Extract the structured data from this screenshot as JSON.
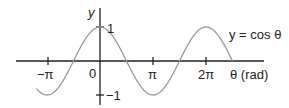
{
  "chart_data": {
    "type": "line",
    "title": "",
    "function": "cos",
    "series": [
      {
        "name": "y = cos θ",
        "x_start_rad": -3.77,
        "x_end_rad": 7.85,
        "color": "#9a9a9a"
      }
    ],
    "xlabel": "θ (rad)",
    "ylabel": "y",
    "x_ticks": [
      {
        "value": -3.14159,
        "label": "−π"
      },
      {
        "value": 0,
        "label": "0"
      },
      {
        "value": 3.14159,
        "label": "π"
      },
      {
        "value": 6.28319,
        "label": "2π"
      }
    ],
    "y_ticks": [
      {
        "value": 1,
        "label": "1"
      },
      {
        "value": -1,
        "label": "−1"
      }
    ],
    "ylim": [
      -1.2,
      1.6
    ],
    "grid": false,
    "legend": "inline annotation near curve end (upper right)"
  },
  "labels": {
    "y_axis": "y",
    "one": "1",
    "neg_one": "−1",
    "origin": "0",
    "neg_pi": "−π",
    "pi": "π",
    "two_pi": "2π",
    "x_axis": "θ (rad)",
    "curve": "y = cos θ"
  },
  "colors": {
    "axis": "#222222",
    "curve": "#9a9a9a"
  }
}
